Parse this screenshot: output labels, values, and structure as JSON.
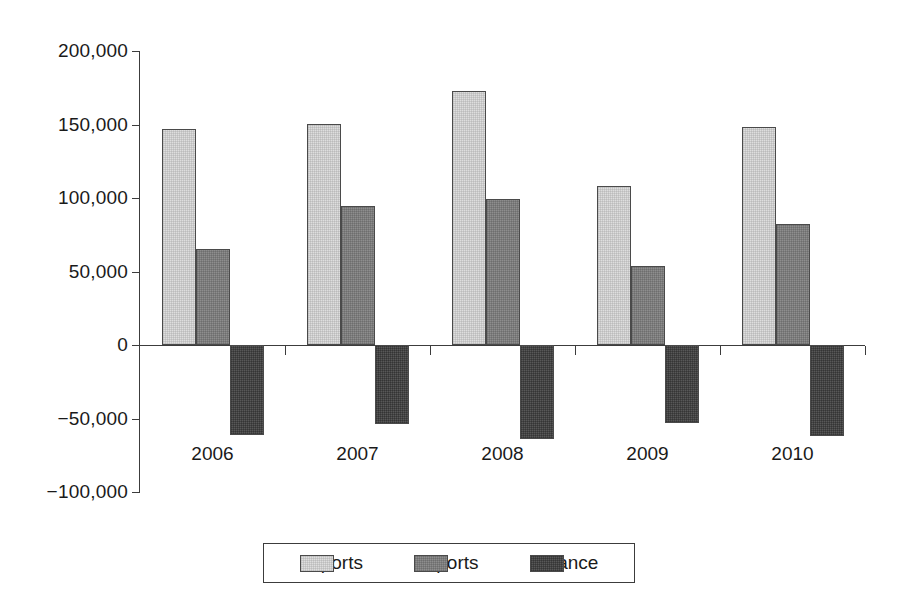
{
  "chart_data": {
    "type": "bar",
    "title": "",
    "subtitle": "",
    "xlabel": "",
    "ylabel": "",
    "categories": [
      "2006",
      "2007",
      "2008",
      "2009",
      "2010"
    ],
    "series": [
      {
        "name": "Imports",
        "color": "#dedede",
        "values": [
          147000,
          150500,
          173000,
          108000,
          148000
        ]
      },
      {
        "name": "Exports",
        "color": "#8e8e8e",
        "values": [
          65000,
          94500,
          99000,
          54000,
          82500
        ]
      },
      {
        "name": "Balance",
        "color": "#585858",
        "values": [
          -61000,
          -53500,
          -64000,
          -53000,
          -62000
        ]
      }
    ],
    "ylim": [
      -100000,
      200000
    ],
    "yticks": [
      200000,
      150000,
      100000,
      50000,
      0,
      -50000,
      -100000
    ],
    "ytick_labels": [
      "200,000",
      "150,000",
      "100,000",
      "50,000",
      "0",
      "−50,000",
      "−100,000"
    ],
    "grid": false,
    "legend_position": "bottom",
    "bar_layout": "grouped-adjacent",
    "zero_line": true
  },
  "legend": {
    "items": [
      {
        "label": "Imports",
        "swatch_name": "legend-swatch-imports"
      },
      {
        "label": "Exports",
        "swatch_name": "legend-swatch-exports"
      },
      {
        "label": "Balance",
        "swatch_name": "legend-swatch-balance"
      }
    ]
  }
}
